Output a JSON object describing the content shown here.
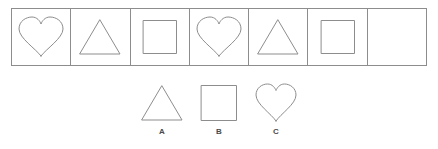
{
  "puzzle": {
    "type": "shape-sequence-pattern",
    "stroke_color": "#8d8d8d",
    "background_color": "#ffffff",
    "sequence": {
      "cell_count": 7,
      "cells": [
        {
          "index": 1,
          "shape": "heart",
          "shape_icon": "heart-icon",
          "empty": false
        },
        {
          "index": 2,
          "shape": "triangle",
          "shape_icon": "triangle-icon",
          "empty": false
        },
        {
          "index": 3,
          "shape": "square",
          "shape_icon": "square-icon",
          "empty": false
        },
        {
          "index": 4,
          "shape": "heart",
          "shape_icon": "heart-icon",
          "empty": false
        },
        {
          "index": 5,
          "shape": "triangle",
          "shape_icon": "triangle-icon",
          "empty": false
        },
        {
          "index": 6,
          "shape": "square",
          "shape_icon": "square-icon",
          "empty": false
        },
        {
          "index": 7,
          "shape": "",
          "shape_icon": "",
          "empty": true
        }
      ]
    },
    "options": [
      {
        "label": "A",
        "shape": "triangle",
        "shape_icon": "triangle-icon"
      },
      {
        "label": "B",
        "shape": "square",
        "shape_icon": "square-icon"
      },
      {
        "label": "C",
        "shape": "heart",
        "shape_icon": "heart-icon"
      }
    ],
    "caption": ""
  }
}
